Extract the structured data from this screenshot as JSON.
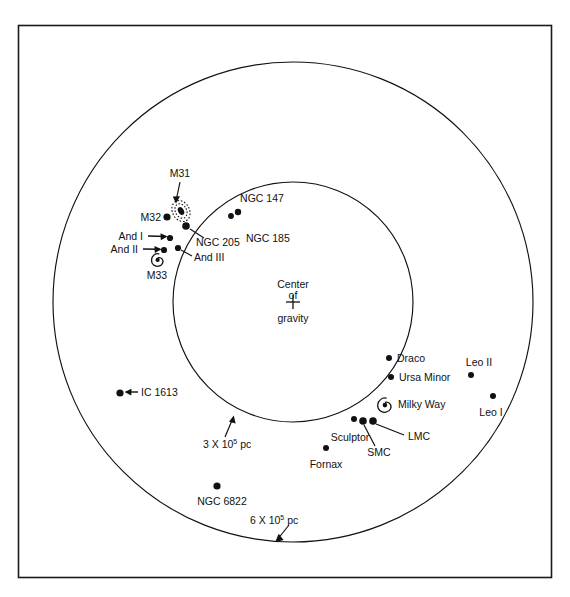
{
  "page": {
    "header_title": "",
    "folio": ""
  },
  "figure": {
    "name": "local-group-galaxies-map",
    "frame": {
      "x": 18,
      "y": 25,
      "width": 534,
      "height": 553
    },
    "center_of_gravity": {
      "label_line1": "Center",
      "label_line2": "of",
      "label_line3": "gravity",
      "marker": "plus",
      "x": 293,
      "y": 302
    },
    "circles": [
      {
        "name": "inner-circle",
        "label": "3 X 10",
        "label_exponent": "5",
        "label_unit": "pc",
        "cx": 293,
        "cy": 302,
        "r": 120
      },
      {
        "name": "outer-circle",
        "label": "6 X 10",
        "label_exponent": "5",
        "label_unit": "pc",
        "cx": 293,
        "cy": 302,
        "r": 240
      }
    ],
    "objects": [
      {
        "name": "m31",
        "label": "M31",
        "glyph": "spiral",
        "x": 181,
        "y": 211,
        "label_x": 180,
        "label_y": 177,
        "anchor": "middle"
      },
      {
        "name": "m32",
        "label": "M32",
        "glyph": "dot",
        "x": 167,
        "y": 217,
        "label_x": 161,
        "label_y": 218,
        "anchor": "end"
      },
      {
        "name": "ngc-205",
        "label": "NGC 205",
        "glyph": "dot",
        "x": 186,
        "y": 226,
        "label_x": 196,
        "label_y": 242,
        "anchor": "start"
      },
      {
        "name": "and-i",
        "label": "And I",
        "glyph": "dot",
        "x": 170,
        "y": 238,
        "label_x": 116,
        "label_y": 239,
        "anchor": "end"
      },
      {
        "name": "and-ii",
        "label": "And II",
        "glyph": "dot",
        "x": 164,
        "y": 250,
        "label_x": 110,
        "label_y": 251,
        "anchor": "end"
      },
      {
        "name": "and-iii",
        "label": "And III",
        "glyph": "dot",
        "x": 178,
        "y": 248,
        "label_x": 191,
        "label_y": 258,
        "anchor": "start"
      },
      {
        "name": "m33",
        "label": "M33",
        "glyph": "spiral",
        "x": 157,
        "y": 259,
        "label_x": 157,
        "label_y": 275,
        "anchor": "middle"
      },
      {
        "name": "ngc-147",
        "label": "NGC 147",
        "glyph": "dot",
        "x": 238,
        "y": 212,
        "label_x": 262,
        "label_y": 199,
        "anchor": "middle"
      },
      {
        "name": "ngc-185",
        "label": "NGC 185",
        "glyph": "dot",
        "x": 231,
        "y": 215,
        "label_x": 246,
        "label_y": 238,
        "anchor": "start"
      },
      {
        "name": "ic-1613",
        "label": "IC 1613",
        "glyph": "dot",
        "x": 120,
        "y": 393,
        "label_x": 141,
        "label_y": 397,
        "anchor": "start"
      },
      {
        "name": "ngc-6822",
        "label": "NGC 6822",
        "glyph": "dot",
        "x": 217,
        "y": 486,
        "label_x": 222,
        "label_y": 503,
        "anchor": "middle"
      },
      {
        "name": "draco",
        "label": "Draco",
        "glyph": "dot",
        "x": 389,
        "y": 358,
        "label_x": 397,
        "label_y": 362,
        "anchor": "start"
      },
      {
        "name": "ursa-minor",
        "label": "Ursa Minor",
        "glyph": "dot",
        "x": 391,
        "y": 377,
        "label_x": 399,
        "label_y": 381,
        "anchor": "start"
      },
      {
        "name": "milky-way",
        "label": "Milky Way",
        "glyph": "spiral",
        "x": 384,
        "y": 404,
        "label_x": 398,
        "label_y": 408,
        "anchor": "start"
      },
      {
        "name": "lmc",
        "label": "LMC",
        "glyph": "dot",
        "x": 373,
        "y": 421,
        "label_x": 408,
        "label_y": 436,
        "anchor": "start"
      },
      {
        "name": "smc",
        "label": "SMC",
        "glyph": "dot",
        "x": 363,
        "y": 421,
        "label_x": 379,
        "label_y": 452,
        "anchor": "middle"
      },
      {
        "name": "sculptor",
        "label": "Sculptor",
        "glyph": "dot",
        "x": 354,
        "y": 419,
        "label_x": 350,
        "label_y": 437,
        "anchor": "middle"
      },
      {
        "name": "fornax",
        "label": "Fornax",
        "glyph": "dot",
        "x": 326,
        "y": 448,
        "label_x": 326,
        "label_y": 465,
        "anchor": "middle"
      },
      {
        "name": "leo-ii",
        "label": "Leo II",
        "glyph": "dot",
        "x": 471,
        "y": 375,
        "label_x": 479,
        "label_y": 366,
        "anchor": "middle"
      },
      {
        "name": "leo-i",
        "label": "Leo I",
        "glyph": "dot",
        "x": 493,
        "y": 396,
        "label_x": 491,
        "label_y": 413,
        "anchor": "middle"
      }
    ]
  }
}
